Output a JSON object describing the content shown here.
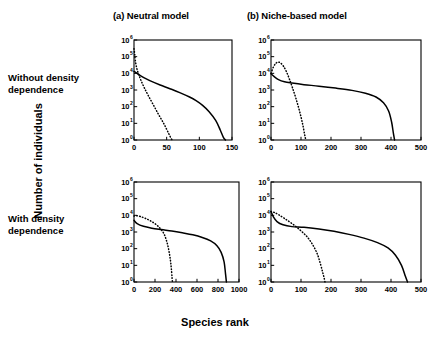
{
  "figure": {
    "column_titles": [
      {
        "id": "a",
        "label": "(a) Neutral model"
      },
      {
        "id": "b",
        "label": "(b) Niche-based model"
      }
    ],
    "row_titles": [
      {
        "id": "top",
        "label": "Without density\ndependence"
      },
      {
        "id": "bottom",
        "label": "With density\ndependence"
      }
    ],
    "axis_titles": {
      "y": "Number of individuals",
      "x": "Species rank"
    }
  },
  "chart_data": [
    {
      "id": "panel-a",
      "type": "line",
      "title": "(a) Neutral model",
      "row": "Without density dependence",
      "xlabel": "Species rank",
      "ylabel": "Number of individuals",
      "xlim": [
        0,
        150
      ],
      "ylim": [
        1,
        1000000
      ],
      "yscale": "log",
      "xticks": [
        0,
        50,
        100,
        150
      ],
      "ytick_labels": [
        "10^0",
        "10^1",
        "10^2",
        "10^3",
        "10^4",
        "10^5",
        "10^6"
      ],
      "grid": false,
      "legend": "none",
      "series": [
        {
          "name": "solid",
          "style": "solid",
          "x": [
            0,
            3,
            8,
            15,
            25,
            40,
            55,
            70,
            85,
            95,
            105,
            115,
            125,
            132,
            137,
            140
          ],
          "y": [
            13000,
            11000,
            8000,
            5500,
            3500,
            2000,
            1200,
            700,
            380,
            230,
            120,
            50,
            15,
            4,
            1.4,
            1
          ]
        },
        {
          "name": "dotted",
          "style": "dotted",
          "x": [
            0,
            1,
            2,
            4,
            7,
            11,
            16,
            22,
            30,
            38,
            46,
            53,
            57,
            59
          ],
          "y": [
            300000,
            150000,
            60000,
            22000,
            9000,
            3500,
            1300,
            450,
            120,
            32,
            9,
            2.5,
            1.2,
            1
          ]
        }
      ]
    },
    {
      "id": "panel-b",
      "type": "line",
      "title": "(b) Niche-based model",
      "row": "Without density dependence",
      "xlabel": "Species rank",
      "ylabel": "Number of individuals",
      "xlim": [
        0,
        500
      ],
      "ylim": [
        1,
        1000000
      ],
      "yscale": "log",
      "xticks": [
        0,
        100,
        200,
        300,
        400,
        500
      ],
      "ytick_labels": [
        "10^0",
        "10^1",
        "10^2",
        "10^3",
        "10^4",
        "10^5",
        "10^6"
      ],
      "grid": false,
      "legend": "none",
      "series": [
        {
          "name": "solid",
          "style": "solid",
          "x": [
            0,
            10,
            25,
            45,
            70,
            110,
            160,
            215,
            270,
            315,
            350,
            375,
            392,
            402,
            408,
            412
          ],
          "y": [
            9500,
            6500,
            4200,
            3100,
            2600,
            2100,
            1700,
            1300,
            950,
            640,
            380,
            170,
            55,
            12,
            2.5,
            1
          ]
        },
        {
          "name": "dotted",
          "style": "dotted",
          "x": [
            0,
            8,
            16,
            24,
            32,
            42,
            52,
            62,
            72,
            84,
            95,
            105,
            112,
            116
          ],
          "y": [
            10000,
            24000,
            40000,
            47000,
            42000,
            26000,
            12000,
            4200,
            1300,
            280,
            55,
            10,
            2.2,
            1
          ]
        }
      ]
    },
    {
      "id": "panel-c",
      "type": "line",
      "title": "(a) Neutral model",
      "row": "With density dependence",
      "xlabel": "Species rank",
      "ylabel": "Number of individuals",
      "xlim": [
        0,
        1000
      ],
      "ylim": [
        1,
        1000000
      ],
      "yscale": "log",
      "xticks": [
        0,
        200,
        400,
        600,
        800,
        1000
      ],
      "ytick_labels": [
        "10^0",
        "10^1",
        "10^2",
        "10^3",
        "10^4",
        "10^5",
        "10^6"
      ],
      "grid": false,
      "legend": "none",
      "series": [
        {
          "name": "solid",
          "style": "solid",
          "x": [
            0,
            30,
            90,
            170,
            260,
            360,
            460,
            560,
            650,
            730,
            790,
            830,
            858,
            872,
            880
          ],
          "y": [
            5000,
            3200,
            2200,
            1700,
            1400,
            1150,
            900,
            680,
            470,
            290,
            150,
            60,
            16,
            3,
            1
          ]
        },
        {
          "name": "dotted",
          "style": "dotted",
          "x": [
            0,
            20,
            60,
            110,
            170,
            230,
            280,
            310,
            330,
            345,
            355,
            362,
            366
          ],
          "y": [
            9000,
            9500,
            8500,
            6500,
            4200,
            2200,
            900,
            300,
            90,
            25,
            7,
            2,
            1
          ]
        }
      ]
    },
    {
      "id": "panel-d",
      "type": "line",
      "title": "(b) Niche-based model",
      "row": "With density dependence",
      "xlabel": "Species rank",
      "ylabel": "Number of individuals",
      "xlim": [
        0,
        500
      ],
      "ylim": [
        1,
        1000000
      ],
      "yscale": "log",
      "xticks": [
        0,
        100,
        200,
        300,
        400,
        500
      ],
      "ytick_labels": [
        "10^0",
        "10^1",
        "10^2",
        "10^3",
        "10^4",
        "10^5",
        "10^6"
      ],
      "grid": false,
      "legend": "none",
      "series": [
        {
          "name": "solid",
          "style": "solid",
          "x": [
            0,
            8,
            20,
            40,
            70,
            110,
            160,
            210,
            260,
            310,
            355,
            390,
            415,
            435,
            448,
            455
          ],
          "y": [
            17000,
            8000,
            4200,
            2700,
            2100,
            1900,
            1500,
            1100,
            720,
            430,
            230,
            110,
            40,
            10,
            2.2,
            1
          ]
        },
        {
          "name": "dotted",
          "style": "dotted",
          "x": [
            0,
            10,
            25,
            45,
            70,
            95,
            120,
            140,
            155,
            165,
            172,
            177,
            180
          ],
          "y": [
            17000,
            15000,
            11000,
            6500,
            3200,
            1400,
            520,
            160,
            45,
            12,
            4,
            1.8,
            1
          ]
        }
      ]
    }
  ]
}
